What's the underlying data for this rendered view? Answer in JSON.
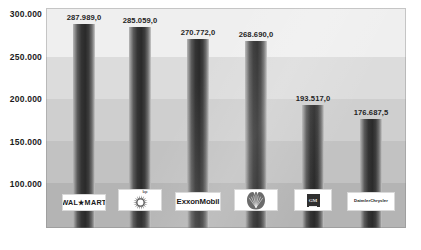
{
  "chart_data": {
    "type": "bar",
    "title": "",
    "subtitle": "",
    "xlabel": "",
    "ylabel": "",
    "categories": [
      "Wal-Mart",
      "BP",
      "ExxonMobil",
      "Shell",
      "GM",
      "DaimlerChrysler"
    ],
    "values": [
      287989.0,
      285059.0,
      270772.0,
      268690.0,
      193517.0,
      176687.5
    ],
    "value_labels": [
      "287.989,0",
      "285.059,0",
      "270.772,0",
      "268.690,0",
      "193.517,0",
      "176.687,5"
    ],
    "y_ticks": [
      300000,
      250000,
      200000,
      150000,
      100000
    ],
    "y_tick_labels": [
      "300.000",
      "250.000",
      "200.000",
      "150.000",
      "100.000"
    ],
    "ylim": [
      0,
      300000
    ],
    "grid": false,
    "legend": false,
    "legend_position": "none",
    "bars_clipped_at_bottom": true,
    "number_format": "de-DE (. thousands, , decimal)"
  },
  "axis": {
    "y_tick_labels": [
      "300.000",
      "250.000",
      "200.000",
      "150.000",
      "100.000"
    ]
  },
  "series": [
    {
      "category": "Wal-Mart",
      "value_label": "287.989,0",
      "logo_kind": "wordmark",
      "logo_text": "WAL★MART"
    },
    {
      "category": "BP",
      "value_label": "285.059,0",
      "logo_kind": "helios",
      "logo_text": "bp"
    },
    {
      "category": "ExxonMobil",
      "value_label": "270.772,0",
      "logo_kind": "wordmark",
      "logo_text": "ExxonMobil"
    },
    {
      "category": "Shell",
      "value_label": "268.690,0",
      "logo_kind": "pecten",
      "logo_text": ""
    },
    {
      "category": "GM",
      "value_label": "193.517,0",
      "logo_kind": "square-emblem",
      "logo_text": "GM"
    },
    {
      "category": "DaimlerChrysler",
      "value_label": "176.687,5",
      "logo_kind": "wordmark",
      "logo_text": "DaimlerChrysler"
    }
  ],
  "colors": {
    "bar_dark": "#2a2a2a",
    "bar_light": "#cfcfcf",
    "plot_background": "#c6c6c6",
    "text": "#1b1b1b",
    "logo_plate": "#ffffff"
  },
  "background_bands": [
    {
      "top": 0,
      "height": 49,
      "color": "#efefef"
    },
    {
      "top": 49,
      "height": 42,
      "color": "#dcdcdc"
    },
    {
      "top": 91,
      "height": 42,
      "color": "#cfcfcf"
    },
    {
      "top": 133,
      "height": 42,
      "color": "#c2c2c2"
    },
    {
      "top": 175,
      "height": 45,
      "color": "#b4b4b4"
    }
  ]
}
